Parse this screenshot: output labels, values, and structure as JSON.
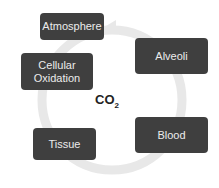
{
  "diagram": {
    "type": "cycle",
    "center_label": "CO",
    "center_subscript": "2",
    "nodes": [
      {
        "label": "Atmosphere"
      },
      {
        "label": "Alveoli"
      },
      {
        "label": "Blood"
      },
      {
        "label": "Tissue"
      },
      {
        "label": "Cellular\nOxidation"
      }
    ],
    "colors": {
      "node_fill": "#3f3f3f",
      "node_text": "#ececec",
      "ring": "#e6e6e6"
    }
  }
}
